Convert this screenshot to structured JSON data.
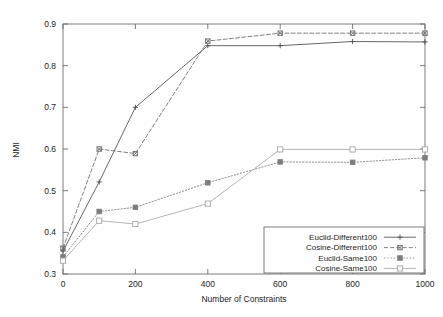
{
  "chart_data": {
    "type": "line",
    "title": "",
    "subtitle": "",
    "xlabel": "Number of Constraints",
    "ylabel": "NMI",
    "xlim": [
      0,
      1000
    ],
    "ylim": [
      0.3,
      0.9
    ],
    "xticks": [
      0,
      200,
      400,
      600,
      800,
      1000
    ],
    "xtick_labels": [
      "0",
      "200",
      "400",
      "600",
      "800",
      "1000"
    ],
    "yticks": [
      0.3,
      0.4,
      0.5,
      0.6,
      0.7,
      0.8,
      0.9
    ],
    "ytick_labels": [
      "0.3",
      "0.4",
      "0.5",
      "0.6",
      "0.7",
      "0.8",
      "0.9"
    ],
    "grid": false,
    "legend_position": "lower right",
    "x": [
      0,
      100,
      200,
      400,
      600,
      800,
      1000
    ],
    "series": [
      {
        "name": "Euclid-Different100",
        "values": [
          0.355,
          0.521,
          0.7,
          0.848,
          0.848,
          0.858,
          0.857
        ],
        "marker": "plus",
        "linestyle": "solid",
        "color": "#4d4d4d"
      },
      {
        "name": "Cosine-Different100",
        "values": [
          0.362,
          0.6,
          0.589,
          0.859,
          0.878,
          0.878,
          0.878
        ],
        "marker": "asterisk-box",
        "linestyle": "dashed",
        "color": "#6a6a6a"
      },
      {
        "name": "Euclid-Same100",
        "values": [
          0.341,
          0.45,
          0.46,
          0.519,
          0.569,
          0.568,
          0.579
        ],
        "marker": "filled-square",
        "linestyle": "dotted",
        "color": "#7d7d7d"
      },
      {
        "name": "Cosine-Same100",
        "values": [
          0.332,
          0.428,
          0.42,
          0.469,
          0.599,
          0.599,
          0.599
        ],
        "marker": "open-square",
        "linestyle": "solid-light",
        "color": "#a6a6a6"
      }
    ]
  },
  "legend": {
    "entries": [
      {
        "label": "Euclid-Different100"
      },
      {
        "label": "Cosine-Different100"
      },
      {
        "label": "Euclid-Same100"
      },
      {
        "label": "Cosine-Same100"
      }
    ]
  }
}
